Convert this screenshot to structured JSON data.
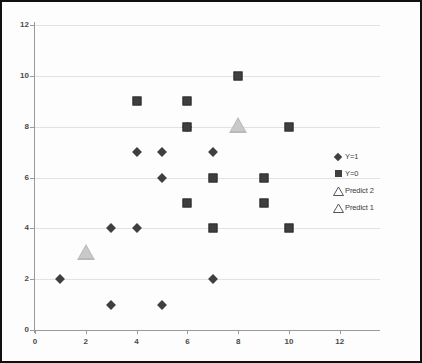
{
  "chart_data": {
    "type": "scatter",
    "title": "",
    "xlabel": "",
    "ylabel": "",
    "xlim": [
      0,
      12
    ],
    "ylim": [
      0,
      12
    ],
    "xticks": [
      0,
      2,
      4,
      6,
      8,
      10,
      12
    ],
    "yticks": [
      0,
      2,
      4,
      6,
      8,
      10,
      12
    ],
    "grid": "horizontal",
    "legend_position": "right",
    "series": [
      {
        "name": "Y=1",
        "marker": "diamond",
        "color": "#3f3f3f",
        "points": [
          [
            1,
            2
          ],
          [
            3,
            1
          ],
          [
            3,
            4
          ],
          [
            4,
            4
          ],
          [
            4,
            7
          ],
          [
            5,
            1
          ],
          [
            5,
            6
          ],
          [
            5,
            7
          ],
          [
            6,
            8
          ],
          [
            7,
            2
          ],
          [
            7,
            7
          ]
        ]
      },
      {
        "name": "Y=0",
        "marker": "square",
        "color": "#3f3f3f",
        "points": [
          [
            4,
            9
          ],
          [
            6,
            5
          ],
          [
            6,
            8
          ],
          [
            6,
            9
          ],
          [
            7,
            4
          ],
          [
            7,
            6
          ],
          [
            8,
            10
          ],
          [
            9,
            5
          ],
          [
            9,
            6
          ],
          [
            10,
            4
          ],
          [
            10,
            8
          ]
        ]
      },
      {
        "name": "Predict 2",
        "marker": "triangle",
        "color": "#c9c9c9",
        "points": [
          [
            8,
            8
          ]
        ]
      },
      {
        "name": "Predict 1",
        "marker": "triangle",
        "color": "#c9c9c9",
        "points": [
          [
            2,
            3
          ]
        ]
      }
    ]
  },
  "legend": {
    "entries": [
      {
        "label": "Y=1",
        "marker": "diamond"
      },
      {
        "label": "Y=0",
        "marker": "square"
      },
      {
        "label": "Predict 2",
        "marker": "triangle"
      },
      {
        "label": "Predict 1",
        "marker": "triangle"
      }
    ]
  }
}
